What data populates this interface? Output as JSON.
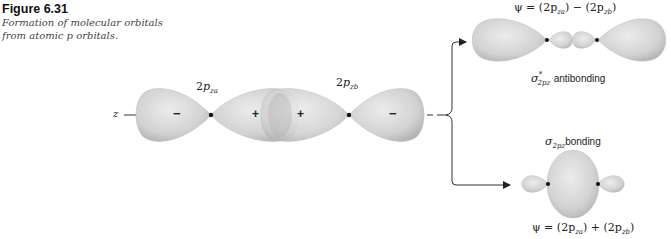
{
  "caption": {
    "figure_number": "Figure 6.31",
    "text": "Formation of molecular orbitals from atomic p orbitals."
  },
  "diagram": {
    "axis_label": "z",
    "atomic_orbitals": [
      {
        "label": "2p",
        "sub": "za",
        "lobes": [
          {
            "sign": "−"
          },
          {
            "sign": "+"
          }
        ]
      },
      {
        "label": "2p",
        "sub": "zb",
        "lobes": [
          {
            "sign": "+"
          },
          {
            "sign": "−"
          }
        ]
      }
    ],
    "antibonding": {
      "equation": "ψ = (2p za) − (2p zb)",
      "eq_left": "ψ = (2p",
      "eq_sub_a": "za",
      "eq_mid": ") − (2p",
      "eq_sub_b": "zb",
      "eq_end": ")",
      "symbol": "σ",
      "symbol_sup": "*",
      "symbol_sub": "2pz",
      "label": "antibonding"
    },
    "bonding": {
      "eq_left": "ψ = (2p",
      "eq_sub_a": "za",
      "eq_mid": ") + (2p",
      "eq_sub_b": "zb",
      "eq_end": ")",
      "symbol": "σ",
      "symbol_sub": "2pz",
      "label": "bonding"
    },
    "colors": {
      "lobe_fill": "#d6d6d6",
      "lobe_edge": "#b0b0b0",
      "node": "#111111",
      "arrow": "#333333"
    }
  }
}
